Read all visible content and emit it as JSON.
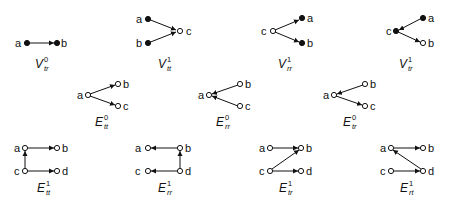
{
  "diagrams": {
    "v_tr_0": {
      "base": "V",
      "sup": "0",
      "sub": "tr",
      "nodes": {
        "a": "a",
        "b": "b"
      }
    },
    "v_tt_1": {
      "base": "V",
      "sup": "1",
      "sub": "tt",
      "nodes": {
        "a": "a",
        "b": "b",
        "c": "c"
      }
    },
    "v_rr_1": {
      "base": "V",
      "sup": "1",
      "sub": "rr",
      "nodes": {
        "a": "a",
        "b": "b",
        "c": "c"
      }
    },
    "v_tr_1": {
      "base": "V",
      "sup": "1",
      "sub": "tr",
      "nodes": {
        "a": "a",
        "b": "b",
        "c": "c"
      }
    },
    "e_tt_0": {
      "base": "E",
      "sup": "0",
      "sub": "tt",
      "nodes": {
        "a": "a",
        "b": "b",
        "c": "c"
      }
    },
    "e_rr_0": {
      "base": "E",
      "sup": "0",
      "sub": "rr",
      "nodes": {
        "a": "a",
        "b": "b",
        "c": "c"
      }
    },
    "e_tr_0": {
      "base": "E",
      "sup": "0",
      "sub": "tr",
      "nodes": {
        "a": "a",
        "b": "b",
        "c": "c"
      }
    },
    "e_tt_1": {
      "base": "E",
      "sup": "1",
      "sub": "tt",
      "nodes": {
        "a": "a",
        "b": "b",
        "c": "c",
        "d": "d"
      }
    },
    "e_rr_1": {
      "base": "E",
      "sup": "1",
      "sub": "rr",
      "nodes": {
        "a": "a",
        "b": "b",
        "c": "c",
        "d": "d"
      }
    },
    "e_tr_1": {
      "base": "E",
      "sup": "1",
      "sub": "tr",
      "nodes": {
        "a": "a",
        "b": "b",
        "c": "c",
        "d": "d"
      }
    },
    "e_rt_1": {
      "base": "E",
      "sup": "1",
      "sub": "rt",
      "nodes": {
        "a": "a",
        "b": "b",
        "c": "c",
        "d": "d"
      }
    }
  }
}
